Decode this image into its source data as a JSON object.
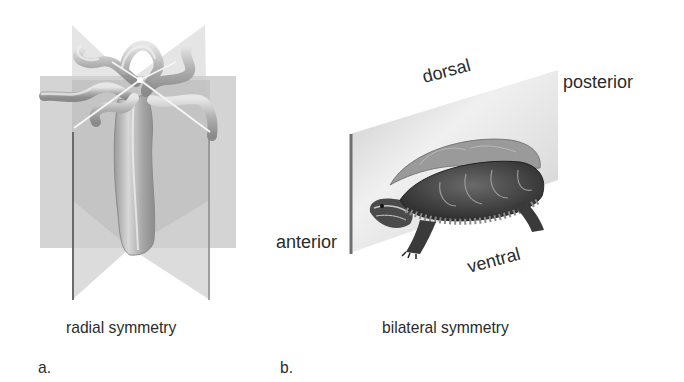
{
  "figure": {
    "panel_a": {
      "letter": "a.",
      "caption": "radial symmetry",
      "subject": "hydra"
    },
    "panel_b": {
      "letter": "b.",
      "caption": "bilateral symmetry",
      "subject": "turtle",
      "orientation_labels": {
        "dorsal": "dorsal",
        "ventral": "ventral",
        "anterior": "anterior",
        "posterior": "posterior"
      }
    }
  },
  "colors": {
    "plane_light": "#dcdcdc",
    "plane_mid": "#c4c4c4",
    "plane_dark": "#a8a8a8",
    "body": "#b5b5b5",
    "text": "#2b2b2b"
  }
}
